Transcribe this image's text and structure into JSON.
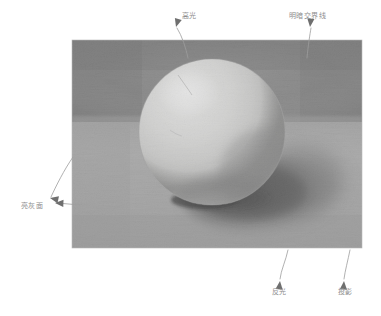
{
  "figure": {
    "type": "pencil-shading-diagram",
    "alt": "铅笔素描球体五大调子示意图"
  },
  "drawing": {
    "frame": {
      "x": 72,
      "y": 40,
      "width": 290,
      "height": 208
    },
    "horizon_y": 122,
    "sphere": {
      "cx": 212,
      "cy": 132,
      "r": 73
    },
    "highlight": {
      "cx": 188,
      "cy": 92,
      "rx": 30,
      "ry": 24
    },
    "cast_shadow": {
      "cx": 258,
      "cy": 196,
      "rx": 78,
      "ry": 36
    },
    "tones": {
      "wall_dark": "#7c7c7c",
      "wall_light": "#9a9a9a",
      "table_light": "#b4b4b4",
      "table_mid": "#a0a0a0",
      "sphere_light": "#ededed",
      "sphere_highlight": "#f7f7f5",
      "sphere_terminator": "#7a7a7a",
      "sphere_reflect": "#b8b8b8",
      "shadow_core": "#3a3a3a",
      "shadow_soft": "#6a6a6a"
    }
  },
  "annotations": {
    "line_color": "#9d9d9d",
    "text_color": "#8e8e8e",
    "items": [
      {
        "id": "highlight",
        "label": "高光",
        "label_x": 182,
        "label_y": 13,
        "arrow_tip_x": 176,
        "arrow_tip_y": 27,
        "leader": "M 188 58 C 186 48 182 36 177 28"
      },
      {
        "id": "terminator",
        "label": "明暗交界线",
        "label_x": 289,
        "label_y": 13,
        "arrow_tip_x": 310,
        "arrow_tip_y": 27,
        "leader": "M 307 58 C 308 46 310 34 311 28"
      },
      {
        "id": "light-gray-plane",
        "label": "亮灰面",
        "label_x": 21,
        "label_y": 203,
        "arrow_tip_x": 50,
        "arrow_tip_y": 198,
        "arrow_tip2_x": 55,
        "arrow_tip2_y": 203,
        "leader": "M 73 157 C 64 170 56 186 51 197",
        "leader2": "M 80 205 L 57 203"
      },
      {
        "id": "reflected-light",
        "label": "反光",
        "label_x": 272,
        "label_y": 289,
        "arrow_tip_x": 280,
        "arrow_tip_y": 281,
        "leader": "M 288 250 C 286 260 281 270 280 279"
      },
      {
        "id": "cast-shadow",
        "label": "投影",
        "label_x": 338,
        "label_y": 289,
        "arrow_tip_x": 344,
        "arrow_tip_y": 281,
        "leader": "M 350 250 C 348 260 345 271 344 279"
      }
    ]
  }
}
